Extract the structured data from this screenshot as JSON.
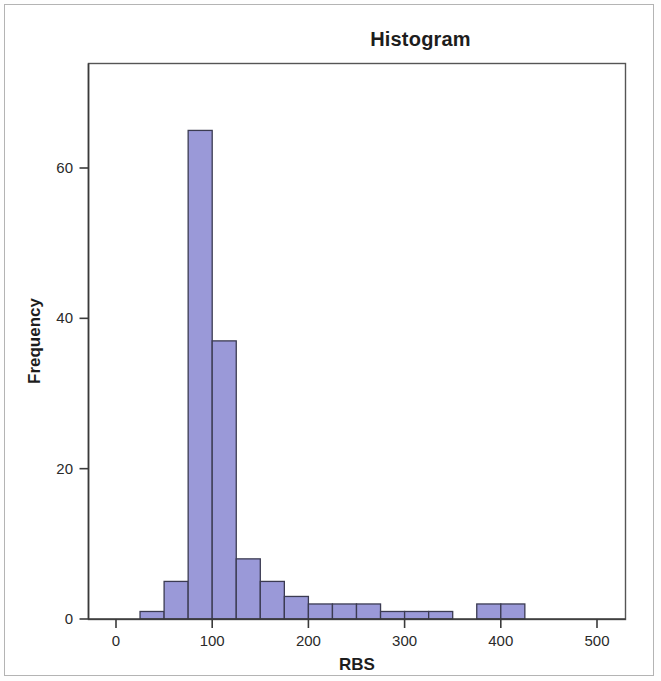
{
  "chart_data": {
    "type": "bar",
    "title": "Histogram",
    "xlabel": "RBS",
    "ylabel": "Frequency",
    "xlim": [
      -30,
      535
    ],
    "ylim": [
      0,
      72
    ],
    "xticks": [
      0,
      100,
      200,
      300,
      400,
      500
    ],
    "xtick_labels": [
      "0",
      "100",
      "200",
      "300",
      "400",
      "500"
    ],
    "yticks": [
      0,
      20,
      40,
      60
    ],
    "ytick_labels": [
      "0",
      "20",
      "40",
      "60"
    ],
    "grid": false,
    "legend": null,
    "bin_width": 25,
    "bar_color": "#9a99d8",
    "bar_edge_color": "#3b3b52",
    "bins": [
      {
        "start": 25,
        "end": 50,
        "value": 1
      },
      {
        "start": 50,
        "end": 75,
        "value": 5
      },
      {
        "start": 75,
        "end": 100,
        "value": 65
      },
      {
        "start": 100,
        "end": 125,
        "value": 37
      },
      {
        "start": 125,
        "end": 150,
        "value": 8
      },
      {
        "start": 150,
        "end": 175,
        "value": 5
      },
      {
        "start": 175,
        "end": 200,
        "value": 3
      },
      {
        "start": 200,
        "end": 225,
        "value": 2
      },
      {
        "start": 225,
        "end": 250,
        "value": 2
      },
      {
        "start": 250,
        "end": 275,
        "value": 2
      },
      {
        "start": 275,
        "end": 300,
        "value": 1
      },
      {
        "start": 300,
        "end": 325,
        "value": 1
      },
      {
        "start": 325,
        "end": 350,
        "value": 1
      },
      {
        "start": 375,
        "end": 400,
        "value": 2
      },
      {
        "start": 400,
        "end": 425,
        "value": 2
      }
    ],
    "categories": [
      "25-50",
      "50-75",
      "75-100",
      "100-125",
      "125-150",
      "150-175",
      "175-200",
      "200-225",
      "225-250",
      "250-275",
      "275-300",
      "300-325",
      "325-350",
      "375-400",
      "400-425"
    ],
    "values": [
      1,
      5,
      65,
      37,
      8,
      5,
      3,
      2,
      2,
      2,
      1,
      1,
      1,
      2,
      2
    ]
  }
}
